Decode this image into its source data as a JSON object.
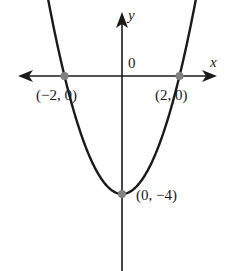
{
  "chart_data": {
    "type": "line",
    "title": "",
    "function": "y = x^2 - 4",
    "xlabel": "x",
    "ylabel": "y",
    "origin_label": "0",
    "grid": false,
    "legend": null,
    "xlim": [
      -3.6,
      3.3
    ],
    "ylim": [
      -2.6,
      2.6
    ],
    "points": [
      {
        "x": -2,
        "y": 0,
        "label": "(−2, 0)"
      },
      {
        "x": 2,
        "y": 0,
        "label": "(2, 0)"
      },
      {
        "x": 0,
        "y": -4,
        "label": "(0, −4)"
      }
    ],
    "colors": {
      "curve": "#1a1a1a",
      "axes": "#1a1a1a",
      "points": "#808080"
    }
  }
}
